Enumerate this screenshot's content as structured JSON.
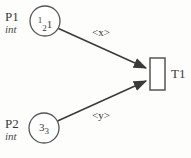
{
  "diagram": {
    "kind": "petri-net",
    "background_color": "#fdfdfc",
    "stroke_color": "#4a4a4a",
    "text_color": "#3a3a3a"
  },
  "places": [
    {
      "id": "p1",
      "name": "P1",
      "type": "int",
      "marking_text": "1 2 1",
      "marking_main": "1",
      "marking_sub": "2",
      "marking_tail": "1",
      "cx": 45,
      "cy": 21,
      "r": 15
    },
    {
      "id": "p2",
      "name": "P2",
      "type": "int",
      "marking_text": "3 3",
      "marking_main": "3",
      "marking_sub": "3",
      "marking_tail": "",
      "cx": 44,
      "cy": 128,
      "r": 15
    }
  ],
  "transition": {
    "id": "t1",
    "name": "T1",
    "x": 150,
    "y": 58,
    "width": 15,
    "height": 32
  },
  "arcs": [
    {
      "id": "arc-p1-t1",
      "from": "P1",
      "to": "T1",
      "label": "<x>",
      "label_x": 92,
      "label_y": 27
    },
    {
      "id": "arc-p2-t1",
      "from": "P2",
      "to": "T1",
      "label": "<y>",
      "label_x": 92,
      "label_y": 110
    }
  ]
}
